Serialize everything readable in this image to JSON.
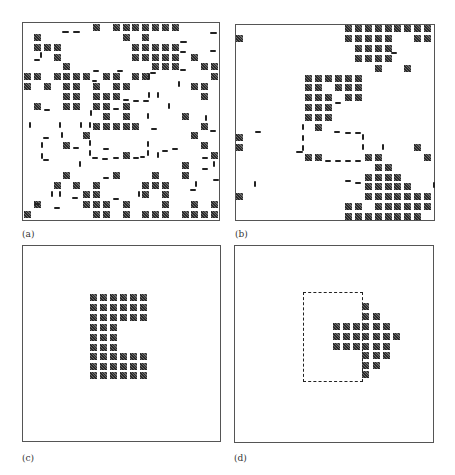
{
  "figure": {
    "panels": [
      {
        "id": "a",
        "label": "(a)",
        "frame": {
          "x": 22,
          "y": 22,
          "w": 198,
          "h": 199
        },
        "label_pos": {
          "x": 22,
          "y": 229
        },
        "grid": {
          "origin_x": 24,
          "origin_y": 24,
          "pitch": 9.85,
          "cols": 20,
          "rows": 20
        },
        "rows": [
          [
            7,
            9,
            10,
            11,
            12,
            13,
            14,
            15
          ],
          [
            1,
            10,
            12
          ],
          [
            1,
            2,
            3,
            11,
            12,
            13,
            14,
            15
          ],
          [
            3,
            11,
            12,
            13,
            14,
            15,
            17
          ],
          [
            4,
            13,
            14,
            15,
            18,
            19
          ],
          [
            0,
            1,
            3,
            4,
            5,
            6,
            8,
            9,
            11,
            12,
            19
          ],
          [
            0,
            2,
            4,
            5,
            7,
            9,
            10,
            17,
            18
          ],
          [
            4,
            5,
            7,
            8,
            9,
            18
          ],
          [
            1,
            4,
            5,
            7,
            8,
            10
          ],
          [
            8,
            10,
            16
          ],
          [
            7,
            8,
            9,
            10,
            11,
            18
          ],
          [
            6,
            17
          ],
          [
            4,
            18
          ],
          [
            10,
            19
          ],
          [
            16
          ],
          [
            4,
            9,
            13,
            16
          ],
          [
            3,
            5,
            7,
            12,
            13,
            14
          ],
          [
            6,
            7,
            12,
            14
          ],
          [
            1,
            6,
            7,
            8,
            10,
            14,
            17,
            19
          ],
          [
            0,
            7,
            8,
            10,
            12,
            13,
            14,
            16,
            17,
            18,
            19
          ]
        ],
        "dashes": [
          {
            "t": "h",
            "x": 62,
            "y": 31,
            "l": 7
          },
          {
            "t": "h",
            "x": 73,
            "y": 31,
            "l": 7
          },
          {
            "t": "h",
            "x": 210,
            "y": 32,
            "l": 7
          },
          {
            "t": "h",
            "x": 180,
            "y": 41,
            "l": 7
          },
          {
            "t": "h",
            "x": 180,
            "y": 51,
            "l": 6
          },
          {
            "t": "h",
            "x": 210,
            "y": 50,
            "l": 6
          },
          {
            "t": "h",
            "x": 34,
            "y": 59,
            "l": 6
          },
          {
            "t": "v",
            "x": 40,
            "y": 52,
            "l": 6
          },
          {
            "t": "h",
            "x": 93,
            "y": 70,
            "l": 6
          },
          {
            "t": "h",
            "x": 92,
            "y": 80,
            "l": 5
          },
          {
            "t": "h",
            "x": 117,
            "y": 70,
            "l": 6
          },
          {
            "t": "h",
            "x": 150,
            "y": 72,
            "l": 6
          },
          {
            "t": "h",
            "x": 180,
            "y": 69,
            "l": 6
          },
          {
            "t": "v",
            "x": 148,
            "y": 73,
            "l": 7
          },
          {
            "t": "v",
            "x": 178,
            "y": 81,
            "l": 6
          },
          {
            "t": "v",
            "x": 148,
            "y": 92,
            "l": 6
          },
          {
            "t": "v",
            "x": 157,
            "y": 92,
            "l": 6
          },
          {
            "t": "h",
            "x": 44,
            "y": 109,
            "l": 6
          },
          {
            "t": "h",
            "x": 113,
            "y": 108,
            "l": 6
          },
          {
            "t": "h",
            "x": 123,
            "y": 99,
            "l": 6
          },
          {
            "t": "h",
            "x": 133,
            "y": 100,
            "l": 6
          },
          {
            "t": "h",
            "x": 143,
            "y": 100,
            "l": 6
          },
          {
            "t": "v",
            "x": 90,
            "y": 110,
            "l": 6
          },
          {
            "t": "v",
            "x": 168,
            "y": 103,
            "l": 6
          },
          {
            "t": "v",
            "x": 29,
            "y": 122,
            "l": 6
          },
          {
            "t": "v",
            "x": 59,
            "y": 122,
            "l": 6
          },
          {
            "t": "v",
            "x": 80,
            "y": 122,
            "l": 6
          },
          {
            "t": "v",
            "x": 89,
            "y": 122,
            "l": 6
          },
          {
            "t": "v",
            "x": 147,
            "y": 113,
            "l": 6
          },
          {
            "t": "v",
            "x": 205,
            "y": 115,
            "l": 6
          },
          {
            "t": "h",
            "x": 151,
            "y": 128,
            "l": 6
          },
          {
            "t": "h",
            "x": 210,
            "y": 130,
            "l": 6
          },
          {
            "t": "h",
            "x": 43,
            "y": 137,
            "l": 6
          },
          {
            "t": "v",
            "x": 41,
            "y": 142,
            "l": 6
          },
          {
            "t": "v",
            "x": 41,
            "y": 153,
            "l": 6
          },
          {
            "t": "h",
            "x": 43,
            "y": 159,
            "l": 6
          },
          {
            "t": "h",
            "x": 73,
            "y": 147,
            "l": 6
          },
          {
            "t": "v",
            "x": 61,
            "y": 132,
            "l": 6
          },
          {
            "t": "v",
            "x": 89,
            "y": 140,
            "l": 6
          },
          {
            "t": "v",
            "x": 89,
            "y": 150,
            "l": 6
          },
          {
            "t": "h",
            "x": 92,
            "y": 157,
            "l": 6
          },
          {
            "t": "h",
            "x": 102,
            "y": 158,
            "l": 6
          },
          {
            "t": "h",
            "x": 113,
            "y": 157,
            "l": 6
          },
          {
            "t": "h",
            "x": 133,
            "y": 157,
            "l": 6
          },
          {
            "t": "v",
            "x": 147,
            "y": 141,
            "l": 6
          },
          {
            "t": "v",
            "x": 147,
            "y": 150,
            "l": 6
          },
          {
            "t": "h",
            "x": 140,
            "y": 156,
            "l": 5
          },
          {
            "t": "v",
            "x": 157,
            "y": 152,
            "l": 6
          },
          {
            "t": "h",
            "x": 162,
            "y": 150,
            "l": 6
          },
          {
            "t": "h",
            "x": 172,
            "y": 148,
            "l": 6
          },
          {
            "t": "h",
            "x": 103,
            "y": 148,
            "l": 6
          },
          {
            "t": "v",
            "x": 79,
            "y": 161,
            "l": 6
          },
          {
            "t": "h",
            "x": 202,
            "y": 157,
            "l": 6
          },
          {
            "t": "h",
            "x": 202,
            "y": 168,
            "l": 6
          },
          {
            "t": "v",
            "x": 213,
            "y": 161,
            "l": 6
          },
          {
            "t": "h",
            "x": 103,
            "y": 177,
            "l": 6
          },
          {
            "t": "h",
            "x": 213,
            "y": 179,
            "l": 6
          },
          {
            "t": "v",
            "x": 195,
            "y": 181,
            "l": 6
          },
          {
            "t": "h",
            "x": 190,
            "y": 189,
            "l": 6
          },
          {
            "t": "v",
            "x": 51,
            "y": 191,
            "l": 6
          },
          {
            "t": "v",
            "x": 59,
            "y": 191,
            "l": 6
          },
          {
            "t": "h",
            "x": 72,
            "y": 197,
            "l": 6
          },
          {
            "t": "h",
            "x": 113,
            "y": 198,
            "l": 6
          },
          {
            "t": "v",
            "x": 138,
            "y": 191,
            "l": 6
          },
          {
            "t": "h",
            "x": 54,
            "y": 207,
            "l": 6
          },
          {
            "t": "h",
            "x": 34,
            "y": 203,
            "l": 6
          }
        ]
      },
      {
        "id": "b",
        "label": "(b)",
        "frame": {
          "x": 235,
          "y": 24,
          "w": 200,
          "h": 197
        },
        "label_pos": {
          "x": 235,
          "y": 229
        },
        "grid": {
          "origin_x": 236,
          "origin_y": 25,
          "pitch": 9.9,
          "cols": 20,
          "rows": 20
        },
        "rows": [
          [
            11,
            12,
            13,
            14,
            15,
            16,
            17,
            18,
            19
          ],
          [
            0,
            11,
            12,
            13,
            14,
            15,
            18,
            19
          ],
          [
            12,
            13,
            14,
            15
          ],
          [
            12,
            13,
            14,
            15
          ],
          [
            14,
            17
          ],
          [
            7,
            8,
            9,
            10,
            11,
            12
          ],
          [
            7,
            8,
            10,
            11,
            12
          ],
          [
            7,
            8,
            9,
            11,
            12
          ],
          [
            7,
            8,
            9
          ],
          [
            7,
            8,
            9
          ],
          [
            8
          ],
          [
            0
          ],
          [
            0,
            18
          ],
          [
            7,
            8,
            13,
            14,
            19
          ],
          [
            14,
            15
          ],
          [
            13,
            14,
            15,
            16
          ],
          [
            13,
            14,
            15,
            16,
            17
          ],
          [
            0,
            13,
            14,
            15,
            16,
            17,
            18,
            19
          ],
          [
            11,
            12,
            14,
            15,
            16,
            17,
            18,
            19
          ],
          [
            11,
            12,
            13,
            14,
            15,
            16,
            17,
            18
          ]
        ],
        "dashes": [
          {
            "t": "h",
            "x": 391,
            "y": 52,
            "l": 6
          },
          {
            "t": "h",
            "x": 335,
            "y": 102,
            "l": 6
          },
          {
            "t": "h",
            "x": 255,
            "y": 131,
            "l": 6
          },
          {
            "t": "v",
            "x": 302,
            "y": 124,
            "l": 6
          },
          {
            "t": "v",
            "x": 302,
            "y": 135,
            "l": 6
          },
          {
            "t": "v",
            "x": 302,
            "y": 145,
            "l": 6
          },
          {
            "t": "h",
            "x": 296,
            "y": 151,
            "l": 7
          },
          {
            "t": "h",
            "x": 334,
            "y": 131,
            "l": 6
          },
          {
            "t": "h",
            "x": 345,
            "y": 132,
            "l": 6
          },
          {
            "t": "h",
            "x": 355,
            "y": 132,
            "l": 6
          },
          {
            "t": "v",
            "x": 362,
            "y": 134,
            "l": 6
          },
          {
            "t": "v",
            "x": 362,
            "y": 144,
            "l": 6
          },
          {
            "t": "v",
            "x": 382,
            "y": 144,
            "l": 6
          },
          {
            "t": "h",
            "x": 325,
            "y": 160,
            "l": 6
          },
          {
            "t": "h",
            "x": 335,
            "y": 160,
            "l": 6
          },
          {
            "t": "h",
            "x": 345,
            "y": 160,
            "l": 6
          },
          {
            "t": "h",
            "x": 355,
            "y": 160,
            "l": 6
          },
          {
            "t": "h",
            "x": 345,
            "y": 180,
            "l": 6
          },
          {
            "t": "h",
            "x": 355,
            "y": 182,
            "l": 6
          },
          {
            "t": "v",
            "x": 254,
            "y": 181,
            "l": 6
          },
          {
            "t": "v",
            "x": 433,
            "y": 182,
            "l": 6
          }
        ]
      },
      {
        "id": "c",
        "label": "(c)",
        "frame": {
          "x": 22,
          "y": 245,
          "w": 199,
          "h": 197
        },
        "label_pos": {
          "x": 22,
          "y": 453
        },
        "shape": "E",
        "blocks": {
          "xs": [
            90,
            100,
            110,
            120,
            130,
            140
          ],
          "ys": [
            294,
            304,
            314,
            324,
            334,
            344,
            353,
            363,
            372
          ],
          "rows": [
            [
              0,
              1,
              2,
              3,
              4,
              5
            ],
            [
              0,
              1,
              2,
              3,
              4,
              5
            ],
            [
              0,
              1,
              2,
              3,
              4,
              5
            ],
            [
              0,
              1,
              2
            ],
            [
              0,
              1,
              2
            ],
            [
              0,
              1,
              2
            ],
            [
              0,
              1,
              2,
              3,
              4,
              5
            ],
            [
              0,
              1,
              2,
              3,
              4,
              5
            ],
            [
              0,
              1,
              2,
              3,
              4,
              5
            ]
          ]
        }
      },
      {
        "id": "d",
        "label": "(d)",
        "frame": {
          "x": 234,
          "y": 245,
          "w": 200,
          "h": 198
        },
        "label_pos": {
          "x": 234,
          "y": 453
        },
        "shape": "arrow",
        "dashed_rect": {
          "x": 303,
          "y": 292,
          "w": 60,
          "h": 90
        },
        "blocks": {
          "xs": [
            333,
            343,
            353,
            362,
            373,
            383,
            393
          ],
          "ys": [
            303,
            313,
            323,
            333,
            343,
            352,
            362,
            371
          ],
          "rows": [
            [
              3
            ],
            [
              3,
              4
            ],
            [
              0,
              1,
              2,
              3,
              4,
              5
            ],
            [
              0,
              1,
              2,
              3,
              4,
              5,
              6
            ],
            [
              0,
              1,
              2,
              3,
              4,
              5
            ],
            [
              3,
              4,
              5
            ],
            [
              3,
              4
            ],
            [
              3
            ]
          ]
        }
      }
    ]
  }
}
